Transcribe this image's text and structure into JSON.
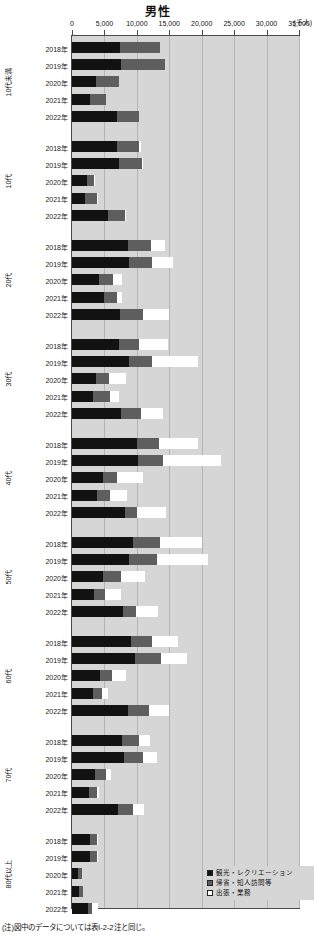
{
  "title": "男性",
  "unit": "(千人)",
  "footnote": "(注)図中のデータについては表Ⅰ-2-2注と同じ。",
  "axis": {
    "ticks": [
      "0",
      "5,000",
      "10,000",
      "15,000",
      "20,000",
      "25,000",
      "30,000",
      "35,000"
    ],
    "tick_values": [
      0,
      5000,
      10000,
      15000,
      20000,
      25000,
      30000,
      35000
    ]
  },
  "legend": {
    "items": [
      {
        "label": "観光・レクリエーション",
        "color": "#121212",
        "key": "sightseeing-recreation"
      },
      {
        "label": "帰省・知人訪問等",
        "color": "#5e5e5e",
        "key": "homecoming-visiting"
      },
      {
        "label": "出張・業務",
        "color": "#ffffff",
        "key": "business-trip"
      }
    ]
  },
  "chart_data": {
    "type": "bar",
    "orientation": "horizontal",
    "title": "男性",
    "xlabel": "(千人)",
    "ylabel": "",
    "xlim": [
      0,
      35000
    ],
    "grid": true,
    "legend_position": "bottom-right",
    "stacked": true,
    "series": [
      {
        "name": "観光・レクリエーション",
        "color": "#121212"
      },
      {
        "name": "帰省・知人訪問等",
        "color": "#5e5e5e"
      },
      {
        "name": "出張・業務",
        "color": "#ffffff"
      }
    ],
    "groups": [
      {
        "age": "10代未満",
        "rows": [
          {
            "year": "2018年",
            "values": [
              7400,
              6100,
              0
            ]
          },
          {
            "year": "2019年",
            "values": [
              7500,
              6800,
              0
            ]
          },
          {
            "year": "2020年",
            "values": [
              3700,
              3500,
              0
            ]
          },
          {
            "year": "2021年",
            "values": [
              2700,
              2500,
              0
            ]
          },
          {
            "year": "2022年",
            "values": [
              7000,
              3300,
              0
            ]
          }
        ]
      },
      {
        "age": "10代",
        "rows": [
          {
            "year": "2018年",
            "values": [
              6900,
              3500,
              200
            ]
          },
          {
            "year": "2019年",
            "values": [
              7300,
              3500,
              200
            ]
          },
          {
            "year": "2020年",
            "values": [
              2300,
              1100,
              100
            ]
          },
          {
            "year": "2021年",
            "values": [
              2000,
              1900,
              100
            ]
          },
          {
            "year": "2022年",
            "values": [
              5600,
              2500,
              200
            ]
          }
        ]
      },
      {
        "age": "20代",
        "rows": [
          {
            "year": "2018年",
            "values": [
              8700,
              3500,
              2100
            ]
          },
          {
            "year": "2019年",
            "values": [
              8800,
              3600,
              3200
            ]
          },
          {
            "year": "2020年",
            "values": [
              4200,
              2100,
              1400
            ]
          },
          {
            "year": "2021年",
            "values": [
              5000,
              1900,
              800
            ]
          },
          {
            "year": "2022年",
            "values": [
              7400,
              3500,
              4000
            ]
          }
        ]
      },
      {
        "age": "30代",
        "rows": [
          {
            "year": "2018年",
            "values": [
              7300,
              3000,
              4500
            ]
          },
          {
            "year": "2019年",
            "values": [
              8800,
              3600,
              7100
            ]
          },
          {
            "year": "2020年",
            "values": [
              3700,
              2000,
              2600
            ]
          },
          {
            "year": "2021年",
            "values": [
              3200,
              2600,
              1400
            ]
          },
          {
            "year": "2022年",
            "values": [
              7500,
              3200,
              3300
            ]
          }
        ]
      },
      {
        "age": "40代",
        "rows": [
          {
            "year": "2018年",
            "values": [
              10000,
              3400,
              6100
            ]
          },
          {
            "year": "2019年",
            "values": [
              10200,
              3800,
              8900
            ]
          },
          {
            "year": "2020年",
            "values": [
              4800,
              2200,
              4000
            ]
          },
          {
            "year": "2021年",
            "values": [
              3800,
              2100,
              2600
            ]
          },
          {
            "year": "2022年",
            "values": [
              8100,
              1900,
              4500
            ]
          }
        ]
      },
      {
        "age": "50代",
        "rows": [
          {
            "year": "2018年",
            "values": [
              9400,
              4100,
              6600
            ]
          },
          {
            "year": "2019年",
            "values": [
              8800,
              4300,
              7800
            ]
          },
          {
            "year": "2020年",
            "values": [
              4800,
              2700,
              3700
            ]
          },
          {
            "year": "2021年",
            "values": [
              3400,
              1700,
              2500
            ]
          },
          {
            "year": "2022年",
            "values": [
              7800,
              2100,
              3300
            ]
          }
        ]
      },
      {
        "age": "60代",
        "rows": [
          {
            "year": "2018年",
            "values": [
              9100,
              3200,
              4100
            ]
          },
          {
            "year": "2019年",
            "values": [
              9700,
              4000,
              4100
            ]
          },
          {
            "year": "2020年",
            "values": [
              4300,
              1900,
              2100
            ]
          },
          {
            "year": "2021年",
            "values": [
              3200,
              1400,
              900
            ]
          },
          {
            "year": "2022年",
            "values": [
              8700,
              3100,
              3200
            ]
          }
        ]
      },
      {
        "age": "70代",
        "rows": [
          {
            "year": "2018年",
            "values": [
              7700,
              2600,
              1700
            ]
          },
          {
            "year": "2019年",
            "values": [
              8000,
              3000,
              2100
            ]
          },
          {
            "year": "2020年",
            "values": [
              3600,
              1700,
              700
            ]
          },
          {
            "year": "2021年",
            "values": [
              2600,
              1200,
              400
            ]
          },
          {
            "year": "2022年",
            "values": [
              7100,
              2300,
              1700
            ]
          }
        ]
      },
      {
        "age": "80代以上",
        "rows": [
          {
            "year": "2018年",
            "values": [
              2700,
              1100,
              100
            ]
          },
          {
            "year": "2019年",
            "values": [
              2700,
              1100,
              100
            ]
          },
          {
            "year": "2020年",
            "values": [
              1000,
              500,
              0
            ]
          },
          {
            "year": "2021年",
            "values": [
              1100,
              600,
              0
            ]
          },
          {
            "year": "2022年",
            "values": [
              2400,
              700,
              900
            ]
          }
        ]
      }
    ]
  }
}
